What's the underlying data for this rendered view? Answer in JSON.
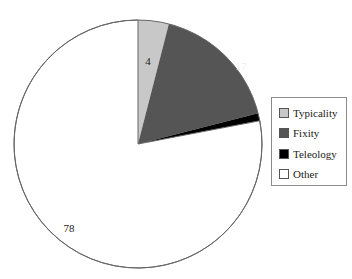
{
  "chart_data": {
    "type": "pie",
    "title": "",
    "categories": [
      "Typicality",
      "Fixity",
      "Teleology",
      "Other"
    ],
    "values": [
      4,
      17,
      1,
      78
    ],
    "colors": [
      "#c8c8c8",
      "#555555",
      "#000000",
      "#ffffff"
    ],
    "data_labels": [
      "4",
      "17",
      "1",
      "78"
    ],
    "start_angle_deg": 0,
    "direction": "clockwise",
    "legend_position": "right"
  },
  "legend": {
    "items": [
      {
        "label": "Typicality",
        "color": "#c8c8c8"
      },
      {
        "label": "Fixity",
        "color": "#555555"
      },
      {
        "label": "Teleology",
        "color": "#000000"
      },
      {
        "label": "Other",
        "color": "#ffffff"
      }
    ]
  }
}
